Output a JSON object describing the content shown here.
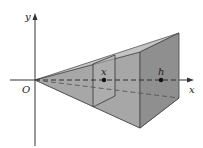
{
  "figure": {
    "type": "pyramid-volume-diagram",
    "labels": {
      "origin": "O",
      "x_axis": "x",
      "y_axis": "y",
      "cross_section": "x",
      "height": "h"
    },
    "colors": {
      "background": "#ffffff",
      "axis": "#333333",
      "face_light": "#c9c9c9",
      "face_mid": "#a9a9a9",
      "face_dark": "#8e8e8e",
      "face_top": "#bdbdbd",
      "edge": "#444444",
      "point": "#111111"
    }
  }
}
